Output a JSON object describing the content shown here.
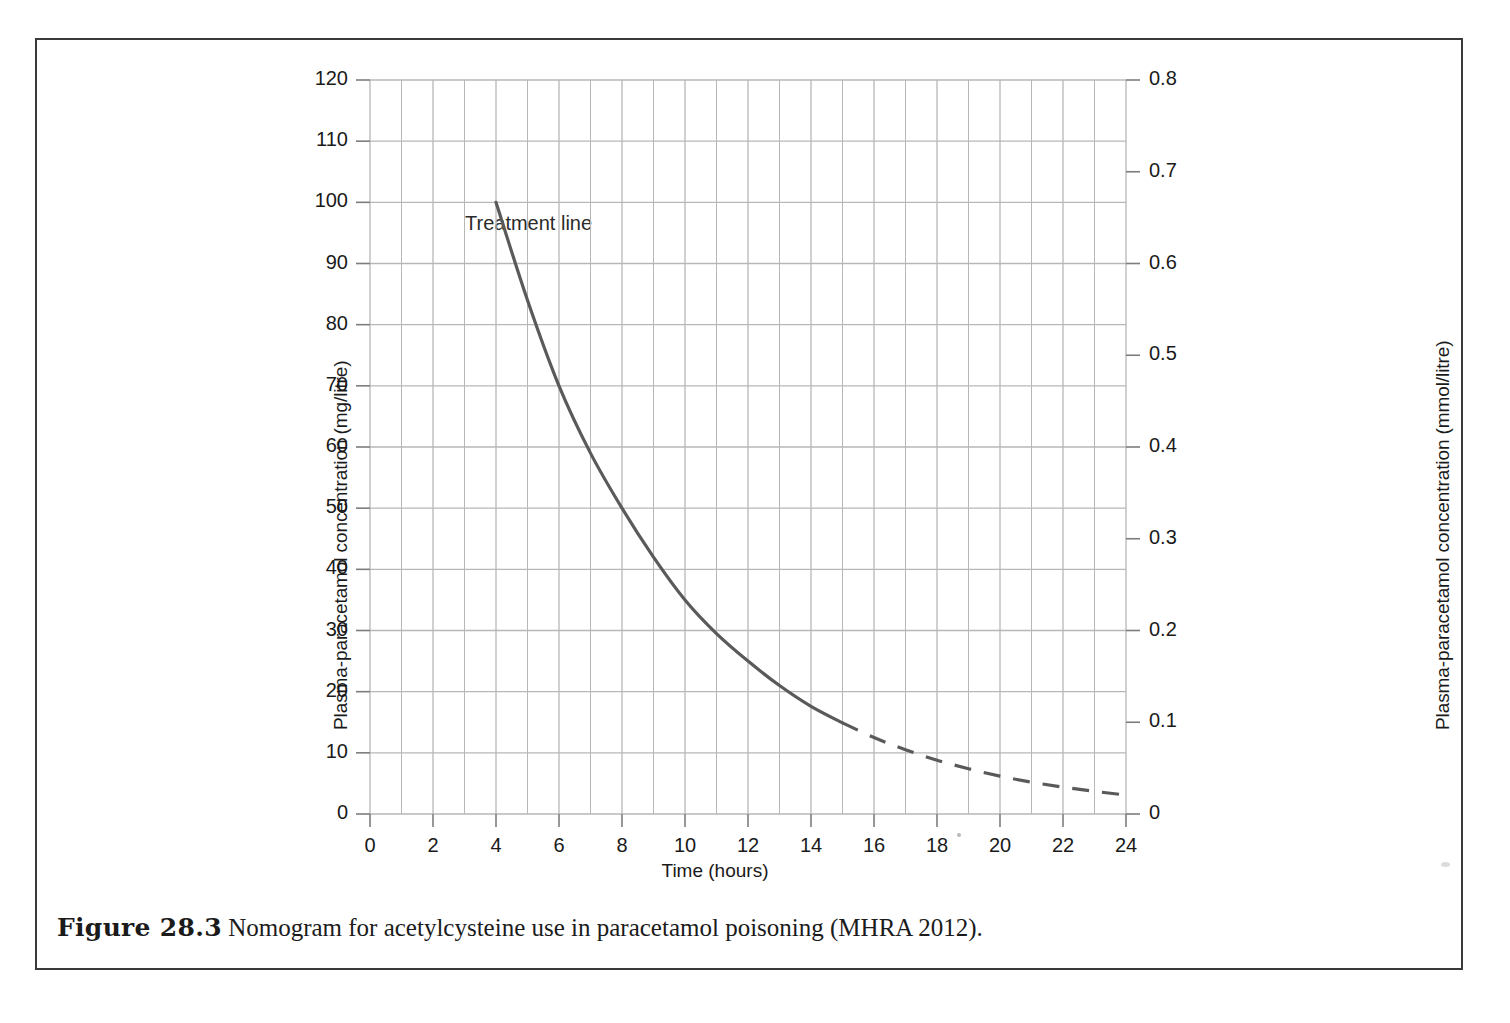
{
  "figure": {
    "caption_label": "Figure 28.3",
    "caption_text": "Nomogram for acetylcysteine use in paracetamol poisoning (MHRA 2012)."
  },
  "chart_data": {
    "type": "line",
    "title": "",
    "xlabel": "Time (hours)",
    "ylabel": "Plasma-paracetamol concentration (mg/litre)",
    "y2label": "Plasma-paracetamol concentration (mmol/litre)",
    "xlim": [
      0,
      24
    ],
    "ylim": [
      0,
      120
    ],
    "y2lim": [
      0,
      0.8
    ],
    "xticks": [
      0,
      2,
      4,
      6,
      8,
      10,
      12,
      14,
      16,
      18,
      20,
      22,
      24
    ],
    "xtick_labels": [
      "0",
      "2",
      "4",
      "6",
      "8",
      "10",
      "12",
      "14",
      "16",
      "18",
      "20",
      "22",
      "24"
    ],
    "yticks": [
      0,
      10,
      20,
      30,
      40,
      50,
      60,
      70,
      80,
      90,
      100,
      110,
      120
    ],
    "ytick_labels": [
      "0",
      "10",
      "20",
      "30",
      "40",
      "50",
      "60",
      "70",
      "80",
      "90",
      "100",
      "110",
      "120"
    ],
    "y2ticks": [
      0,
      0.1,
      0.2,
      0.3,
      0.4,
      0.5,
      0.6,
      0.7,
      0.8
    ],
    "y2tick_labels": [
      "0",
      "0.1",
      "0.2",
      "0.3",
      "0.4",
      "0.5",
      "0.6",
      "0.7",
      "0.8"
    ],
    "grid": true,
    "grid_minor_x_step": 1,
    "legend_position": "inline-annotation",
    "annotations": [
      {
        "text": "Treatment line",
        "x": 4.2,
        "y": 104
      }
    ],
    "series": [
      {
        "name": "Treatment line",
        "color": "#5a5a5a",
        "solid_range": [
          4,
          15
        ],
        "dashed_range": [
          15,
          24
        ],
        "x": [
          4,
          5,
          6,
          7,
          8,
          9,
          10,
          11,
          12,
          13,
          14,
          15,
          16,
          17,
          18,
          19,
          20,
          21,
          22,
          23,
          24
        ],
        "values": [
          100,
          84,
          70,
          59,
          50,
          42,
          35,
          29.5,
          25,
          21,
          17.6,
          14.9,
          12.5,
          10.5,
          8.8,
          7.4,
          6.2,
          5.2,
          4.4,
          3.7,
          3.1
        ]
      }
    ]
  },
  "axis_annotation": {
    "treatment_line": "Treatment line"
  }
}
